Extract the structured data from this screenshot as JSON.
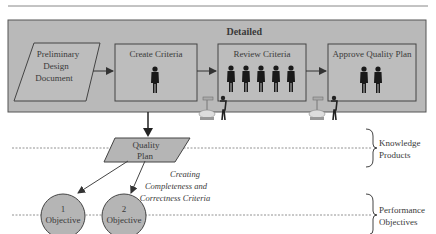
{
  "diagram": {
    "panel_title": "Detailed",
    "colors": {
      "panel_fill": "#b9b9b9",
      "box_fill": "#bdbdbd",
      "stroke": "#555555",
      "text": "#3a3a3a",
      "dotted": "#777777"
    },
    "input_document": [
      "Preliminary",
      "Design",
      "Document"
    ],
    "steps": [
      {
        "label": "Create Criteria",
        "people": 1
      },
      {
        "label": "Review Criteria",
        "people": 5
      },
      {
        "label": "Approve Quality Plan",
        "people": 2
      }
    ],
    "output": [
      "Quality",
      "Plan"
    ],
    "annotation": [
      "Creating",
      "Completeness and",
      "Correctness Criteria"
    ],
    "objectives": [
      {
        "number": "1",
        "label": "Objective"
      },
      {
        "number": "2",
        "label": "Objective"
      }
    ],
    "levels": [
      {
        "label": [
          "Knowledge",
          "Products"
        ]
      },
      {
        "label": [
          "Performance",
          "Objectives"
        ]
      }
    ]
  }
}
